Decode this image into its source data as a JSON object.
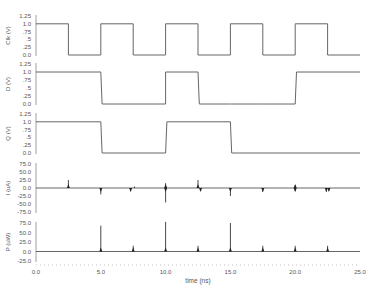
{
  "chart_data": {
    "type": "line",
    "title": "",
    "xlabel": "time (ns)",
    "xlim": [
      0,
      25
    ],
    "x_ticks": [
      "0.0",
      "5.0",
      "10.0",
      "15.0",
      "20.0",
      "25.0"
    ],
    "grid": false,
    "legend": null,
    "panels": [
      {
        "name": "CLK",
        "ylabel": "Clk (V)",
        "ylim": [
          0,
          1.25
        ],
        "y_ticks": [
          "1.25",
          "1.0",
          ".75",
          ".5",
          ".25",
          "0.0"
        ],
        "x": [
          0,
          2.5,
          2.5,
          5.0,
          5.0,
          7.5,
          7.5,
          10.0,
          10.0,
          12.5,
          12.5,
          15.0,
          15.0,
          17.5,
          17.5,
          20.0,
          20.0,
          22.5,
          22.5,
          25.0
        ],
        "values": [
          1,
          1,
          0,
          0,
          1,
          1,
          0,
          0,
          1,
          1,
          0,
          0,
          1,
          1,
          0,
          0,
          1,
          1,
          0,
          0
        ]
      },
      {
        "name": "D",
        "ylabel": "D (V)",
        "ylim": [
          0,
          1.25
        ],
        "y_ticks": [
          "1.25",
          "1.0",
          ".75",
          ".5",
          ".25",
          "0.0"
        ],
        "x": [
          0,
          5.0,
          5.1,
          10.0,
          10.0,
          12.5,
          12.6,
          15.0,
          15.1,
          17.5,
          17.6,
          20.0,
          20.1,
          25.0
        ],
        "values": [
          1,
          1,
          0,
          0,
          1,
          1,
          0,
          0,
          0,
          0,
          0,
          0,
          1,
          1
        ]
      },
      {
        "name": "Q",
        "ylabel": "Q (V)",
        "ylim": [
          0,
          1.25
        ],
        "y_ticks": [
          "1.25",
          "1.0",
          ".75",
          ".5",
          ".25",
          "0.0"
        ],
        "x": [
          0,
          5.0,
          5.1,
          10.0,
          10.1,
          15.0,
          15.1,
          25.0
        ],
        "values": [
          1,
          1,
          0,
          0,
          1,
          1,
          0,
          0
        ]
      },
      {
        "name": "I",
        "ylabel": "I (uA)",
        "ylim": [
          -75,
          75
        ],
        "y_ticks": [
          "75.0",
          "50.0",
          "25.0",
          "0.0",
          "-25.0",
          "-50.0",
          "-75.0"
        ],
        "spikes": [
          {
            "t": 2.5,
            "v": 25
          },
          {
            "t": 5.0,
            "v": -20
          },
          {
            "t": 7.3,
            "v": -10
          },
          {
            "t": 7.6,
            "v": 5
          },
          {
            "t": 10.0,
            "v": 15
          },
          {
            "t": 10.0,
            "v": -45
          },
          {
            "t": 12.5,
            "v": 25
          },
          {
            "t": 12.7,
            "v": -8
          },
          {
            "t": 15.0,
            "v": -25
          },
          {
            "t": 17.5,
            "v": -12
          },
          {
            "t": 20.0,
            "v": 8
          },
          {
            "t": 20.0,
            "v": -10
          },
          {
            "t": 22.4,
            "v": -12
          },
          {
            "t": 22.6,
            "v": -8
          }
        ]
      },
      {
        "name": "P",
        "ylabel": "P (uW)",
        "ylim": [
          -25,
          75
        ],
        "y_ticks": [
          "75.0",
          "50.0",
          "25.0",
          "0.0",
          "-25.0"
        ],
        "spikes": [
          {
            "t": 5.0,
            "v": 68
          },
          {
            "t": 7.5,
            "v": 15
          },
          {
            "t": 10.0,
            "v": 78
          },
          {
            "t": 12.5,
            "v": 15
          },
          {
            "t": 15.0,
            "v": 75
          },
          {
            "t": 17.5,
            "v": 15
          },
          {
            "t": 20.0,
            "v": 15
          },
          {
            "t": 22.5,
            "v": 15
          }
        ]
      }
    ]
  },
  "labels": {
    "xlabel": "time (ns)"
  }
}
